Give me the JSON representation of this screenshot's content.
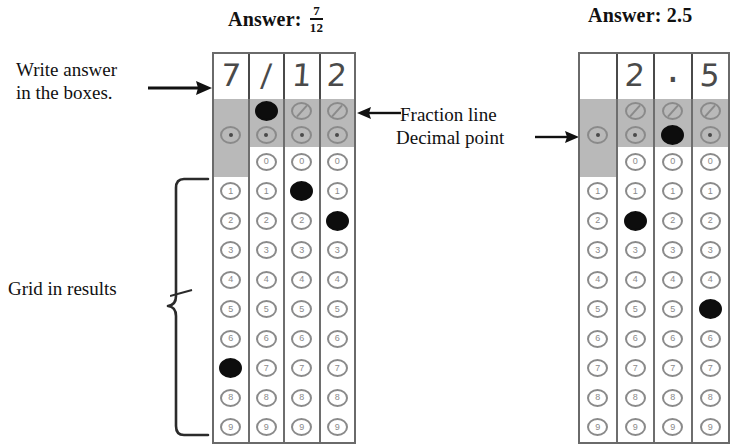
{
  "headings": {
    "left": {
      "prefix": "Answer:",
      "fraction_numerator": "7",
      "fraction_denominator": "12"
    },
    "right": {
      "prefix": "Answer:",
      "value": "2.5"
    }
  },
  "annotations": {
    "write_answer_line1": "Write answer",
    "write_answer_line2": "in the boxes.",
    "fraction_line": "Fraction line",
    "decimal_point": "Decimal point",
    "grid_in_results": "Grid in results"
  },
  "colors": {
    "bubble_outline": "#8a8a8a",
    "filled_bubble": "#0d0d0d",
    "shaded_band": "#b9b9b9",
    "grid_border": "#6a6a6a",
    "text": "#111111",
    "handwriting": "#4a4a4a"
  },
  "grids": [
    {
      "id": "left",
      "answer_shown": "7/12",
      "written_row": [
        "7",
        "/",
        "1",
        "2"
      ],
      "special_rows": [
        "fraction-line",
        "decimal-point"
      ],
      "digit_labels": [
        "0",
        "1",
        "2",
        "3",
        "4",
        "5",
        "6",
        "7",
        "8",
        "9"
      ],
      "columns": [
        {
          "index": 1,
          "written": "7",
          "has_fraction_bubble": false,
          "has_zero_bubble": false,
          "fraction_filled": false,
          "decimal_filled": false,
          "filled_digit": "7"
        },
        {
          "index": 2,
          "written": "/",
          "has_fraction_bubble": true,
          "has_zero_bubble": true,
          "fraction_filled": true,
          "decimal_filled": false,
          "filled_digit": null
        },
        {
          "index": 3,
          "written": "1",
          "has_fraction_bubble": true,
          "has_zero_bubble": true,
          "fraction_filled": false,
          "decimal_filled": false,
          "filled_digit": "1"
        },
        {
          "index": 4,
          "written": "2",
          "has_fraction_bubble": true,
          "has_zero_bubble": true,
          "fraction_filled": false,
          "decimal_filled": false,
          "filled_digit": "2"
        }
      ]
    },
    {
      "id": "right",
      "answer_shown": "2.5",
      "written_row": [
        "",
        "2",
        ".",
        "5"
      ],
      "special_rows": [
        "fraction-line",
        "decimal-point"
      ],
      "digit_labels": [
        "0",
        "1",
        "2",
        "3",
        "4",
        "5",
        "6",
        "7",
        "8",
        "9"
      ],
      "columns": [
        {
          "index": 1,
          "written": "",
          "has_fraction_bubble": false,
          "has_zero_bubble": false,
          "fraction_filled": false,
          "decimal_filled": false,
          "filled_digit": null
        },
        {
          "index": 2,
          "written": "2",
          "has_fraction_bubble": true,
          "has_zero_bubble": true,
          "fraction_filled": false,
          "decimal_filled": false,
          "filled_digit": "2"
        },
        {
          "index": 3,
          "written": ".",
          "has_fraction_bubble": true,
          "has_zero_bubble": true,
          "fraction_filled": false,
          "decimal_filled": true,
          "filled_digit": null
        },
        {
          "index": 4,
          "written": "5",
          "has_fraction_bubble": true,
          "has_zero_bubble": true,
          "fraction_filled": false,
          "decimal_filled": false,
          "filled_digit": "5"
        }
      ]
    }
  ]
}
